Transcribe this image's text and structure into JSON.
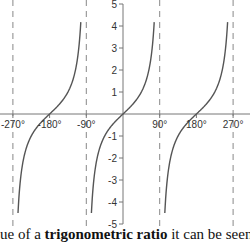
{
  "chart_data": {
    "type": "line",
    "title": "",
    "function": "tan(x)",
    "xlabel": "",
    "ylabel": "",
    "x_ticks": [
      "-270°",
      "-180°",
      "-90°",
      "90°",
      "180°",
      "270°"
    ],
    "x_tick_values": [
      -270,
      -180,
      -90,
      90,
      180,
      270
    ],
    "y_ticks": [
      5,
      4,
      3,
      2,
      1,
      -1,
      -2,
      -3,
      -4,
      -5
    ],
    "ylim": [
      -5,
      5
    ],
    "xlim": [
      -300,
      300
    ],
    "asymptotes": [
      -270,
      -90,
      90,
      270
    ],
    "grid": false,
    "legend": null,
    "series": [
      {
        "name": "tan x branch 1",
        "x": [
          -256,
          -240,
          -225,
          -210,
          -180,
          -150,
          -135,
          -120,
          -103
        ],
        "y": [
          -4.5,
          -1.73,
          -1,
          -0.58,
          0,
          0.58,
          1,
          1.73,
          4.5
        ]
      },
      {
        "name": "tan x branch 2",
        "x": [
          -77,
          -60,
          -45,
          -30,
          0,
          30,
          45,
          60,
          77
        ],
        "y": [
          -4.5,
          -1.73,
          -1,
          -0.58,
          0,
          0.58,
          1,
          1.73,
          4.5
        ]
      },
      {
        "name": "tan x branch 3",
        "x": [
          103,
          120,
          135,
          150,
          180,
          210,
          225,
          240,
          257
        ],
        "y": [
          -4.5,
          -1.73,
          -1,
          -0.58,
          0,
          0.58,
          1,
          1.73,
          4.5
        ]
      }
    ],
    "colors": {
      "curve": "#555555",
      "axis": "#777777",
      "asymptote": "#888888",
      "text": "#333333"
    }
  },
  "caption": {
    "prefix": "ue of a ",
    "bold": "trigonometric ratio",
    "suffix": " it can be seen"
  }
}
